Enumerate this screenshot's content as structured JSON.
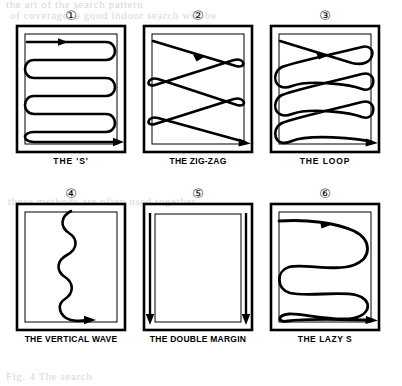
{
  "page": {
    "type": "scanned-figure-page",
    "background_color": "#ffffff",
    "ink_color": "#000000",
    "bleed_text_color": "#d8d8d8",
    "bleed_lines": [
      "the art of the search pattern",
      "of coverage. a good indoor search will be",
      "these methods are often used together",
      "Fig. 4  The search"
    ]
  },
  "figure": {
    "name": "search-pattern-diagrams",
    "columns": 3,
    "rows": 2,
    "panels": [
      {
        "number": "①",
        "number_value": 1,
        "caption": "THE 'S'",
        "pattern": "serpentine-tight-horizontal",
        "description": "Tight horizontal serpentine with rounded 180-degree turns, arrow entering top-left and exiting bottom-right",
        "passes": 5,
        "arrows": 2
      },
      {
        "number": "②",
        "number_value": 2,
        "caption": "THE ZIG-ZAG",
        "pattern": "zigzag-diagonal",
        "description": "Diagonal zig-zag traverses with small pinch loops at each side turn",
        "passes": 4,
        "arrows": 2
      },
      {
        "number": "③",
        "number_value": 3,
        "caption": "THE LOOP",
        "pattern": "loop-teardrop",
        "description": "Diagonal traverses ending in large teardrop loops on alternating sides",
        "passes": 4,
        "arrows": 2
      },
      {
        "number": "④",
        "number_value": 4,
        "caption": "THE VERTICAL WAVE",
        "pattern": "vertical-sine-wave",
        "description": "Single sinuous vertical wave down the centre, turning right with an arrow at the bottom",
        "passes": 1,
        "arrows": 1
      },
      {
        "number": "⑤",
        "number_value": 5,
        "caption": "THE DOUBLE MARGIN",
        "pattern": "double-margin-vertical",
        "description": "Two straight vertical lines down the left and right margins, each ending in a downward arrow",
        "passes": 2,
        "arrows": 2
      },
      {
        "number": "⑥",
        "number_value": 6,
        "caption": "THE LAZY S",
        "pattern": "serpentine-wide-horizontal",
        "description": "Wide loose horizontal serpentine with broad rounded turns, arrow entering top-left and exiting bottom-right",
        "passes": 3,
        "arrows": 2
      }
    ]
  }
}
